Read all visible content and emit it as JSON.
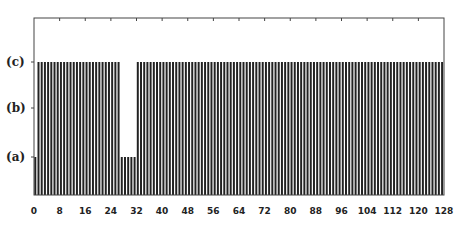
{
  "chart_data": {
    "type": "bar",
    "title": "",
    "xlabel": "",
    "ylabel": "",
    "xlim": [
      0,
      128
    ],
    "x_ticks": [
      "0",
      "8",
      "16",
      "24",
      "32",
      "40",
      "48",
      "56",
      "64",
      "72",
      "80",
      "88",
      "96",
      "104",
      "112",
      "120",
      "128"
    ],
    "y_levels": [
      {
        "label": "(a)",
        "value": 1
      },
      {
        "label": "(b)",
        "value": 2
      },
      {
        "label": "(c)",
        "value": 3
      }
    ],
    "ylim": [
      0,
      3.9
    ],
    "grid": false,
    "legend": null,
    "bar_color": "#222222",
    "segments": [
      {
        "from": 0,
        "to": 0,
        "level": 1
      },
      {
        "from": 1,
        "to": 26,
        "level": 3
      },
      {
        "from": 27,
        "to": 31,
        "level": 1
      },
      {
        "from": 32,
        "to": 127,
        "level": 3
      }
    ],
    "bar_count": 128
  }
}
